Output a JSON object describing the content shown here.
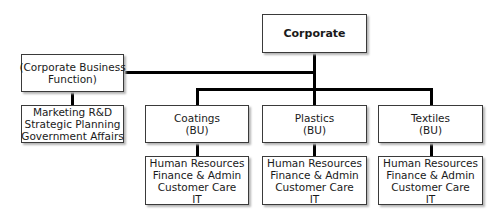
{
  "chart": {
    "root": {
      "label": "Corporate"
    },
    "corporate_function": {
      "label_lines": [
        "(Corporate Business",
        "Function)"
      ],
      "functions": [
        "Marketing R&D",
        "Strategic Planning",
        "Government Affairs"
      ]
    },
    "business_units": [
      {
        "lines": [
          "Coatings",
          "(BU)"
        ],
        "functions": [
          "Human Resources",
          "Finance & Admin",
          "Customer Care",
          "IT"
        ]
      },
      {
        "lines": [
          "Plastics",
          "(BU)"
        ],
        "functions": [
          "Human Resources",
          "Finance & Admin",
          "Customer Care",
          "IT"
        ]
      },
      {
        "lines": [
          "Textiles",
          "(BU)"
        ],
        "functions": [
          "Human Resources",
          "Finance & Admin",
          "Customer Care",
          "IT"
        ]
      }
    ]
  },
  "colors": {
    "line": "#000000",
    "border": "#3a3a3a",
    "shadow": "#b5b5b5"
  }
}
